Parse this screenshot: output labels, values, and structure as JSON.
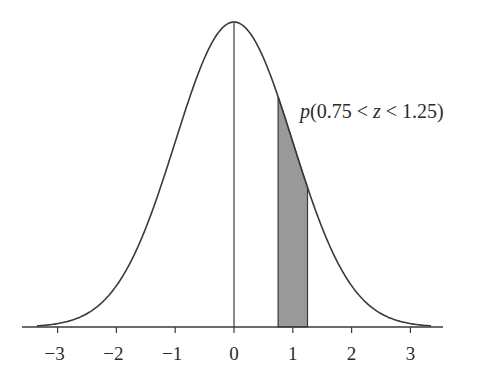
{
  "chart_data": {
    "type": "area",
    "title": "",
    "xlabel": "z",
    "ylabel": "",
    "distribution": "standard normal",
    "mean": 0,
    "sd": 1,
    "xlim": [
      -3.6,
      3.6
    ],
    "x_ticks": [
      -3,
      -2,
      -1,
      0,
      1,
      2,
      3
    ],
    "x_tick_labels": [
      "−3",
      "−2",
      "−1",
      "0",
      "1",
      "2",
      "3"
    ],
    "shaded_region": {
      "from": 0.75,
      "to": 1.25,
      "color": "#9a9a9a"
    },
    "annotation": {
      "prefix": "p",
      "body": "(0.75 < ",
      "var": "z",
      "suffix": " < 1.25)",
      "full_text": "p(0.75 < z < 1.25)"
    },
    "center_line_x": 0,
    "grid": false,
    "legend": false,
    "colors": {
      "curve": "#3a3a3a",
      "axis": "#3a3a3a",
      "fill": "#9a9a9a"
    }
  }
}
